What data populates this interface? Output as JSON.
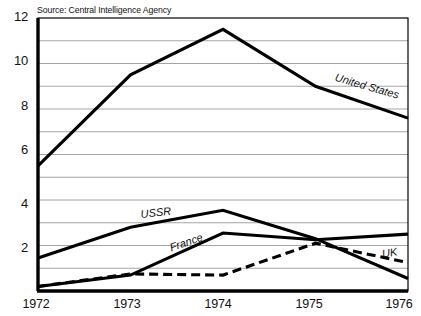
{
  "source_note": "Source: Central Intelligence Agency",
  "axes": {
    "y_ticks": [
      "12",
      "10",
      "8",
      "6",
      "4",
      "2"
    ],
    "x_ticks": [
      "1972",
      "1973",
      "1974",
      "1975",
      "1976"
    ]
  },
  "series_labels": {
    "united_states": "United States",
    "ussr": "USSR",
    "france": "France",
    "uk": "UK"
  },
  "colors": {
    "line": "#000000",
    "grid": "#9a9a9a",
    "frame": "#000000",
    "text": "#111111",
    "background": "#ffffff"
  },
  "chart_data": {
    "type": "line",
    "title": "",
    "subtitle": "",
    "xlabel": "",
    "ylabel": "",
    "x": [
      1972,
      1973,
      1974,
      1975,
      1976
    ],
    "categories": [
      "1972",
      "1973",
      "1974",
      "1975",
      "1976"
    ],
    "xlim": [
      1972,
      1976
    ],
    "ylim": [
      0,
      12
    ],
    "y_major_ticks": [
      2,
      4,
      6,
      8,
      10,
      12
    ],
    "y_minor_ticks": [
      1,
      3,
      5,
      7,
      9,
      11
    ],
    "grid": "horizontal",
    "legend": "inline-labels",
    "annotations": [
      "Source: Central Intelligence Agency"
    ],
    "series": [
      {
        "name": "United States",
        "style": "solid",
        "color": "#000000",
        "values": [
          5.5,
          9.5,
          11.5,
          9.0,
          7.6
        ]
      },
      {
        "name": "USSR",
        "style": "solid",
        "color": "#000000",
        "values": [
          1.45,
          2.8,
          3.55,
          2.3,
          0.55
        ]
      },
      {
        "name": "France",
        "style": "solid",
        "color": "#000000",
        "values": [
          0.2,
          0.7,
          2.55,
          2.25,
          2.5
        ]
      },
      {
        "name": "UK",
        "style": "dashed",
        "color": "#000000",
        "values": [
          0.2,
          0.75,
          0.7,
          2.1,
          1.25
        ]
      }
    ]
  }
}
